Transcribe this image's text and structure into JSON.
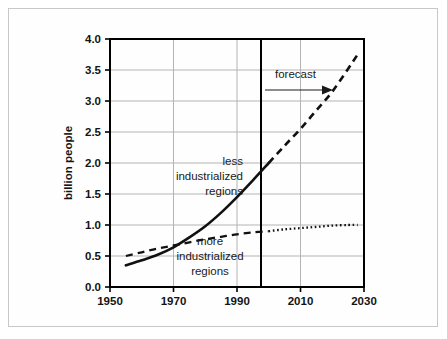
{
  "chart_data": {
    "type": "line",
    "title": "",
    "xlabel": "",
    "ylabel": "billion people",
    "xlim": [
      1950,
      2030
    ],
    "ylim": [
      0.0,
      4.0
    ],
    "grid": true,
    "legend_position": "inline-annotations",
    "x_ticks": [
      "1950",
      "1970",
      "1990",
      "2010",
      "2030"
    ],
    "x_tick_values": [
      1950,
      1970,
      1990,
      2010,
      2030
    ],
    "y_ticks": [
      "0.0",
      "0.5",
      "1.0",
      "1.5",
      "2.0",
      "2.5",
      "3.0",
      "3.5",
      "4.0"
    ],
    "y_tick_values": [
      0.0,
      0.5,
      1.0,
      1.5,
      2.0,
      2.5,
      3.0,
      3.5,
      4.0
    ],
    "annotations": [
      {
        "name": "forecast",
        "text": "forecast",
        "x": 2003,
        "y": 3.25,
        "marker": "arrow-right"
      },
      {
        "name": "less-industrialized",
        "text": "less industrialized regions",
        "lines": [
          "less",
          "industrialized",
          "regions"
        ],
        "x": 1987,
        "y": 1.75
      },
      {
        "name": "more-industrialized",
        "text": "more industrialized regions",
        "lines": [
          "more",
          "industrialized",
          "regions"
        ],
        "x": 1989,
        "y": 0.55
      }
    ],
    "forecast_divider_year": 2000,
    "series": [
      {
        "name": "less industrialized regions",
        "style_historical": "solid",
        "style_forecast": "dashed",
        "x": [
          1955,
          1960,
          1965,
          1970,
          1975,
          1980,
          1985,
          1990,
          1995,
          2000,
          2005,
          2010,
          2015,
          2020,
          2025,
          2028
        ],
        "values": [
          0.35,
          0.43,
          0.52,
          0.64,
          0.8,
          0.98,
          1.2,
          1.45,
          1.72,
          2.0,
          2.28,
          2.55,
          2.85,
          3.15,
          3.52,
          3.75
        ]
      },
      {
        "name": "more industrialized regions",
        "style_historical": "dashed",
        "style_forecast": "dotted",
        "x": [
          1955,
          1960,
          1965,
          1970,
          1975,
          1980,
          1985,
          1990,
          1995,
          2000,
          2005,
          2010,
          2015,
          2020,
          2025,
          2028
        ],
        "values": [
          0.5,
          0.56,
          0.62,
          0.67,
          0.72,
          0.77,
          0.81,
          0.85,
          0.88,
          0.9,
          0.93,
          0.95,
          0.97,
          0.99,
          1.0,
          1.0
        ]
      }
    ]
  },
  "colors": {
    "line": "#111111",
    "grid": "#b4b4b4",
    "axis": "#000000",
    "frame": "#c8c8c8",
    "background": "#ffffff",
    "text": "#141414"
  }
}
